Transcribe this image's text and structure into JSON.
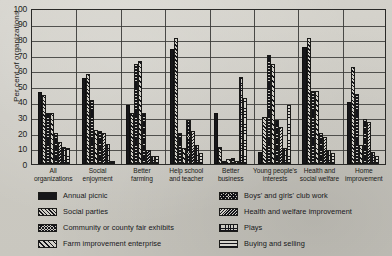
{
  "chart_data": {
    "type": "bar",
    "title": "",
    "xlabel": "",
    "ylabel": "Per cent of organizations",
    "ylim": [
      0,
      100
    ],
    "yticks": [
      0,
      10,
      20,
      30,
      40,
      50,
      60,
      70,
      80,
      90,
      100
    ],
    "grid": "horizontal-and-group-dividers",
    "legend_position": "below-plot-two-columns",
    "categories": [
      "All organizations",
      "Social enjoyment",
      "Better farming",
      "Help school and teacher",
      "Better business",
      "Young people's interests",
      "Health and social welfare",
      "Home improvement"
    ],
    "category_lines": [
      [
        "All",
        "organizations"
      ],
      [
        "Social",
        "enjoyment"
      ],
      [
        "Better",
        "farming"
      ],
      [
        "Help school",
        "and teacher"
      ],
      [
        "Better",
        "business"
      ],
      [
        "Young people's",
        "interests"
      ],
      [
        "Health and",
        "social welfare"
      ],
      [
        "Home",
        "improvement"
      ]
    ],
    "series": [
      {
        "name": "Annual picnic",
        "pattern": "solid",
        "values": [
          46,
          55,
          38,
          74,
          33,
          8,
          75,
          40
        ]
      },
      {
        "name": "Social parties",
        "pattern": "diag",
        "values": [
          44,
          58,
          33,
          81,
          11,
          30,
          81,
          62
        ]
      },
      {
        "name": "Community or county fair exhibits",
        "pattern": "check",
        "values": [
          33,
          41,
          64,
          20,
          2,
          70,
          47,
          45
        ]
      },
      {
        "name": "Farm improvement enterprise",
        "pattern": "diagw",
        "values": [
          33,
          22,
          66,
          10,
          3,
          64,
          47,
          12
        ]
      },
      {
        "name": "Boys' and girls' club work",
        "pattern": "check2",
        "values": [
          20,
          21,
          33,
          28,
          4,
          28,
          20,
          29
        ]
      },
      {
        "name": "Health and welfare improvement",
        "pattern": "fdiag",
        "values": [
          14,
          20,
          9,
          21,
          2,
          24,
          17,
          27
        ]
      },
      {
        "name": "Plays",
        "pattern": "brick",
        "values": [
          11,
          13,
          5,
          12,
          56,
          10,
          9,
          8
        ]
      },
      {
        "name": "Buying and selling",
        "pattern": "horiz",
        "values": [
          10,
          2,
          5,
          7,
          42,
          38,
          7,
          5
        ]
      }
    ]
  },
  "legend": {
    "left_column": [
      {
        "label": "Annual picnic",
        "pattern": "solid"
      },
      {
        "label": "Social parties",
        "pattern": "diag"
      },
      {
        "label": "Community or county fair exhibits",
        "pattern": "check"
      },
      {
        "label": "Farm improvement enterprise",
        "pattern": "diagw"
      }
    ],
    "right_column": [
      {
        "label": "Boys' and girls' club work",
        "pattern": "check2"
      },
      {
        "label": "Health and welfare improvement",
        "pattern": "fdiag"
      },
      {
        "label": "Plays",
        "pattern": "brick"
      },
      {
        "label": "Buying and selling",
        "pattern": "horiz"
      }
    ]
  }
}
